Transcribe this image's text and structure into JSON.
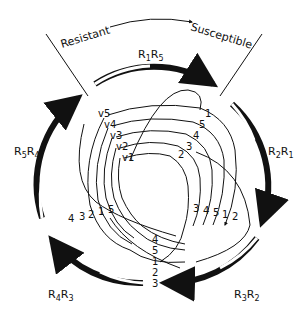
{
  "header": {
    "left_label": "Resistant",
    "right_label": "Susceptible"
  },
  "outer_arrows": [
    {
      "label": "R",
      "sub1": "1",
      "mid": "R",
      "sub2": "5",
      "full": "R1R5"
    },
    {
      "label": "R",
      "sub1": "2",
      "mid": "R",
      "sub2": "1",
      "full": "R2R1"
    },
    {
      "label": "R",
      "sub1": "3",
      "mid": "R",
      "sub2": "2",
      "full": "R3R2"
    },
    {
      "label": "R",
      "sub1": "4",
      "mid": "R",
      "sub2": "3",
      "full": "R4R3"
    },
    {
      "label": "R",
      "sub1": "5",
      "mid": "R",
      "sub2": "4",
      "full": "R5R4"
    }
  ],
  "inner_labels": {
    "top_left": [
      "v5",
      "v4",
      "v3",
      "v2",
      "v1"
    ],
    "top_right": [
      "1",
      "5",
      "4",
      "3",
      "2"
    ],
    "left": [
      "4",
      "3",
      "2",
      "1",
      "5"
    ],
    "right": [
      "3",
      "4",
      "5",
      "1",
      "2"
    ],
    "bottom": [
      "4",
      "5",
      "1",
      "2",
      "3"
    ]
  },
  "colors": {
    "ink": "#111111",
    "background": "#ffffff"
  }
}
